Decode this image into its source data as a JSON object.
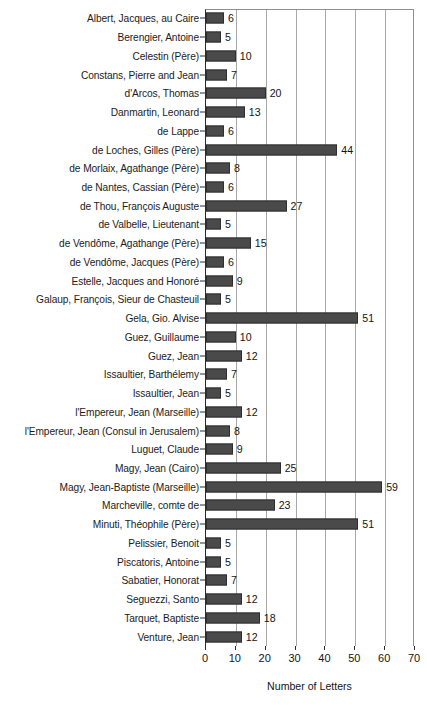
{
  "chart_data": {
    "type": "bar",
    "orientation": "horizontal",
    "title": "",
    "xlabel": "Number of Letters",
    "ylabel": "",
    "xlim": [
      0,
      70
    ],
    "xticks": [
      0,
      10,
      20,
      30,
      40,
      50,
      60,
      70
    ],
    "grid": "vertical-only",
    "legend": "none",
    "show_value_labels": true,
    "bar_color": "#4a4a4a",
    "bar_border_color": "#2e2e2e",
    "gridline_color": "#a8a8a8",
    "axis_color": "#2b2b2b",
    "categories": [
      "Albert, Jacques, au Caire",
      "Berengier, Antoine",
      "Celestin (Père)",
      "Constans, Pierre and Jean",
      "d'Arcos, Thomas",
      "Danmartin, Leonard",
      "de Lappe",
      "de Loches, Gilles (Père)",
      "de Morlaix, Agathange (Père)",
      "de Nantes, Cassian  (Père)",
      "de Thou, François Auguste",
      "de Valbelle, Lieutenant",
      "de Vendôme, Agathange (Père)",
      "de Vendôme, Jacques (Père)",
      "Estelle, Jacques and Honoré",
      "Galaup, François, Sieur de Chasteuil",
      "Gela, Gio. Alvise",
      "Guez, Guillaume",
      "Guez, Jean",
      "Issaultier, Barthélemy",
      "Issaultier, Jean",
      "l'Empereur, Jean (Marseille)",
      "l'Empereur, Jean (Consul in Jerusalem)",
      "Luguet, Claude",
      "Magy, Jean (Cairo)",
      "Magy, Jean-Baptiste (Marseille)",
      "Marcheville, comte de",
      "Minuti, Théophile (Père)",
      "Pelissier, Benoit",
      "Piscatoris, Antoine",
      "Sabatier, Honorat",
      "Seguezzi, Santo",
      "Tarquet, Baptiste",
      "Venture, Jean"
    ],
    "values": [
      6,
      5,
      10,
      7,
      20,
      13,
      6,
      44,
      8,
      6,
      27,
      5,
      15,
      6,
      9,
      5,
      51,
      10,
      12,
      7,
      5,
      12,
      8,
      9,
      25,
      59,
      23,
      51,
      5,
      5,
      7,
      12,
      18,
      12
    ]
  }
}
